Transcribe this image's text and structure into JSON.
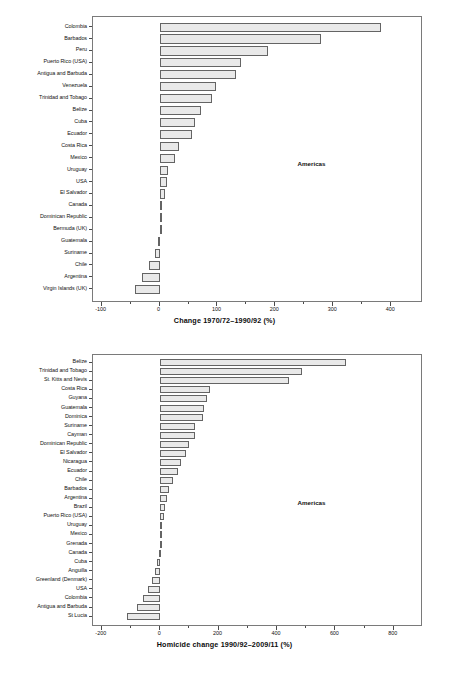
{
  "figure": {
    "background_color": "#ffffff",
    "bar_fill_color": "#e9e9e9",
    "bar_border_color": "#646464",
    "frame_color": "#7a7a7a",
    "text_color": "#111111"
  },
  "chart_data": [
    {
      "type": "bar",
      "orientation": "horizontal",
      "title": "",
      "xlabel": "Change 1970/72–1990/92 (%)",
      "ylabel": "",
      "xlim": [
        -115,
        455
      ],
      "xticks": [
        -100,
        0,
        100,
        200,
        300,
        400
      ],
      "xtick_labels": [
        "-100",
        "0",
        "100",
        "200",
        "300",
        "400"
      ],
      "grid": false,
      "annotation": "Americas",
      "categories": [
        "Colombia",
        "Barbados",
        "Peru",
        "Puerto Rico (USA)",
        "Antigua and Barbuda",
        "Venezuela",
        "Trinidad and Tobago",
        "Belize",
        "Cuba",
        "Ecuador",
        "Costa Rica",
        "Mexico",
        "Uruguay",
        "USA",
        "El Salvador",
        "Canada",
        "Dominican Republic",
        "Bermuda (UK)",
        "Guatemala",
        "Suriname",
        "Chile",
        "Argentina",
        "Virgin Islands (UK)"
      ],
      "values": [
        383,
        279,
        188,
        140,
        132,
        98,
        90,
        72,
        62,
        56,
        34,
        27,
        14,
        12,
        9,
        5,
        2,
        1,
        -2,
        -8,
        -18,
        -30,
        -42
      ]
    },
    {
      "type": "bar",
      "orientation": "horizontal",
      "title": "",
      "xlabel": "Homicide change 1990/92–2009/11 (%)",
      "ylabel": "",
      "xlim": [
        -230,
        900
      ],
      "xticks": [
        -200,
        0,
        200,
        400,
        600,
        800
      ],
      "xtick_labels": [
        "-200",
        "0",
        "200",
        "400",
        "600",
        "800"
      ],
      "grid": false,
      "annotation": "Americas",
      "categories": [
        "Belize",
        "Trinidad and Tobago",
        "St. Kitts and Nevis",
        "Costa Rica",
        "Guyana",
        "Guatemala",
        "Dominica",
        "Suriname",
        "Cayman",
        "Dominican Republic",
        "El Salvador",
        "Nicaragua",
        "Ecuador",
        "Chile",
        "Barbados",
        "Argentina",
        "Brazil",
        "Puerto Rico (USA)",
        "Uruguay",
        "Mexico",
        "Grenada",
        "Canada",
        "Cuba",
        "Anguilla",
        "Greenland (Denmark)",
        "USA",
        "Colombia",
        "Antigua and Barbuda",
        "St Lucia"
      ],
      "values": [
        635,
        485,
        440,
        170,
        160,
        150,
        148,
        120,
        118,
        98,
        88,
        72,
        62,
        45,
        30,
        22,
        18,
        12,
        8,
        5,
        3,
        -4,
        -10,
        -18,
        -28,
        -42,
        -60,
        -78,
        -115
      ]
    }
  ]
}
